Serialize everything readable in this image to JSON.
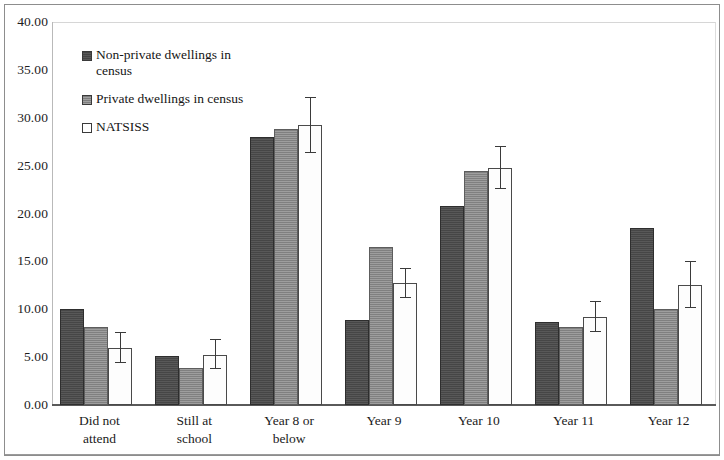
{
  "chart_data": {
    "type": "bar",
    "title": "",
    "subtitle": "",
    "xlabel": "",
    "ylabel": "",
    "ylim": [
      0,
      40
    ],
    "ytick_step": 5,
    "ytick_labels": [
      "0.00",
      "5.00",
      "10.00",
      "15.00",
      "20.00",
      "25.00",
      "30.00",
      "35.00",
      "40.00"
    ],
    "ytick_values": [
      0,
      5,
      10,
      15,
      20,
      25,
      30,
      35,
      40
    ],
    "grid": false,
    "legend_position": "upper-left-inside",
    "categories": [
      "Did not attend",
      "Still at school",
      "Year 8 or below",
      "Year 9",
      "Year 10",
      "Year 11",
      "Year 12"
    ],
    "category_lines": [
      [
        "Did not",
        "attend"
      ],
      [
        "Still at",
        "school"
      ],
      [
        "Year 8 or",
        "below"
      ],
      [
        "Year 9"
      ],
      [
        "Year 10"
      ],
      [
        "Year 11"
      ],
      [
        "Year 12"
      ]
    ],
    "series": [
      {
        "name": "Non-private dwellings in census",
        "color": "#4b4b4b",
        "values": [
          10.0,
          5.1,
          28.0,
          8.9,
          20.8,
          8.7,
          18.5
        ],
        "errors": [
          null,
          null,
          null,
          null,
          null,
          null,
          null
        ]
      },
      {
        "name": "Private dwellings in census",
        "color": "#8e8e8e",
        "values": [
          8.1,
          3.9,
          28.8,
          16.5,
          24.4,
          8.2,
          10.0
        ],
        "errors": [
          null,
          null,
          null,
          null,
          null,
          null,
          null
        ]
      },
      {
        "name": "NATSISS",
        "color": "#ffffff",
        "values": [
          6.0,
          5.2,
          29.2,
          12.7,
          24.8,
          9.2,
          12.5
        ],
        "errors": [
          {
            "low": 4.4,
            "high": 7.5
          },
          {
            "low": 3.8,
            "high": 6.8
          },
          {
            "low": 26.3,
            "high": 32.1
          },
          {
            "low": 11.2,
            "high": 14.2
          },
          {
            "low": 22.6,
            "high": 26.9
          },
          {
            "low": 7.6,
            "high": 10.8
          },
          {
            "low": 10.1,
            "high": 14.9
          }
        ]
      }
    ]
  },
  "legend": {
    "items": [
      {
        "label": "Non-private dwellings in census",
        "swatch": "#4b4b4b"
      },
      {
        "label": "Private dwellings in census",
        "swatch": "#8e8e8e"
      },
      {
        "label": "NATSISS",
        "swatch": "#ffffff"
      }
    ]
  }
}
